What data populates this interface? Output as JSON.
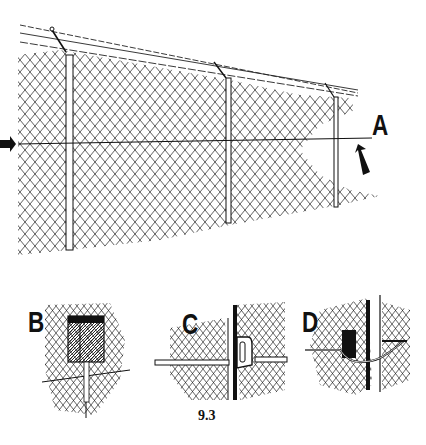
{
  "figure": {
    "caption": "9.3",
    "main_view": {
      "description": "Chain-link fence with posts, barbed-wire top strands and a tension wire",
      "callout_label": "A",
      "posts_count": 3
    },
    "insets": [
      {
        "label": "B",
        "description": "Tension wire attachment block on mesh"
      },
      {
        "label": "C",
        "description": "Tension wire clip at post"
      },
      {
        "label": "D",
        "description": "Tension wire hook fastener at post"
      }
    ]
  },
  "colors": {
    "ink": "#111111",
    "background": "#ffffff"
  }
}
